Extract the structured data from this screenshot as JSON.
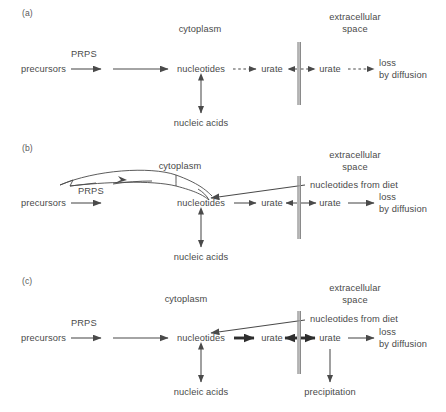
{
  "figure": {
    "type": "biochemical-pathway-diagram",
    "background": "#ffffff",
    "stroke_color": "#4a4a4a",
    "text_color": "#4a4a4a",
    "membrane_color": "#8a8a8a",
    "width": 446,
    "height": 412,
    "panel_count": 3
  },
  "panels": [
    {
      "tag": "(a)",
      "tag_x": 22,
      "tag_y": 8,
      "compartment_labels": [
        {
          "name": "cytoplasm",
          "text": "cytoplasm",
          "x": 200,
          "y": 24
        },
        {
          "name": "extracellular-space",
          "text": "extracellular\nspace",
          "line1": "extracellular",
          "line2": "space",
          "x": 355,
          "y": 12
        }
      ],
      "nodes": [
        {
          "id": "precursors",
          "text": "precursors",
          "x": 21,
          "y": 72,
          "align": "left"
        },
        {
          "id": "prps",
          "text": "PRPS",
          "x": 71,
          "y": 57,
          "align": "left"
        },
        {
          "id": "nucleotides",
          "text": "nucleotides",
          "x": 201,
          "y": 72,
          "align": "center"
        },
        {
          "id": "urate-in",
          "text": "urate",
          "x": 272,
          "y": 72,
          "align": "center"
        },
        {
          "id": "urate-out",
          "text": "urate",
          "x": 330,
          "y": 72,
          "align": "center"
        },
        {
          "id": "loss-by-diffusion",
          "line1": "loss",
          "line2": "by diffusion",
          "x": 379,
          "y": 66,
          "align": "left"
        },
        {
          "id": "nucleic-acids",
          "text": "nucleic acids",
          "x": 201,
          "y": 123,
          "align": "center"
        }
      ],
      "arrows": [
        {
          "from": "precursors",
          "to": "prps-step",
          "style": "solid"
        },
        {
          "from": "prps-step",
          "to": "nucleotides",
          "style": "solid"
        },
        {
          "from": "nucleotides",
          "to": "urate-in",
          "style": "dashed"
        },
        {
          "from": "urate-in",
          "to": "membrane",
          "style": "dashed",
          "direction": "left"
        },
        {
          "from": "membrane",
          "to": "urate-out",
          "style": "dashed"
        },
        {
          "from": "urate-out",
          "to": "loss",
          "style": "dashed"
        },
        {
          "from": "nucleotides",
          "to": "nucleic-acids",
          "style": "solid",
          "direction": "both"
        }
      ],
      "membrane": {
        "x": 299,
        "y_top": 42,
        "y_bottom": 105
      }
    },
    {
      "tag": "(b)",
      "tag_x": 22,
      "tag_y": 143,
      "compartment_labels": [
        {
          "name": "cytoplasm",
          "text": "cytoplasm",
          "x": 180,
          "y": 165
        },
        {
          "name": "extracellular-space",
          "text": "extracellular\nspace",
          "line1": "extracellular",
          "line2": "space",
          "x": 355,
          "y": 155
        }
      ],
      "nodes": [
        {
          "id": "precursors",
          "text": "precursors",
          "x": 21,
          "y": 206,
          "align": "left"
        },
        {
          "id": "prps",
          "text": "PRPS",
          "x": 78,
          "y": 192,
          "align": "left",
          "note": "distorted-glyph"
        },
        {
          "id": "nucleotides",
          "text": "nucleotides",
          "x": 201,
          "y": 206,
          "align": "center"
        },
        {
          "id": "urate-in",
          "text": "urate",
          "x": 272,
          "y": 206,
          "align": "center"
        },
        {
          "id": "urate-out",
          "text": "urate",
          "x": 330,
          "y": 206,
          "align": "center"
        },
        {
          "id": "loss-by-diffusion",
          "line1": "loss",
          "line2": "by diffusion",
          "x": 379,
          "y": 200,
          "align": "left"
        },
        {
          "id": "nucleotides-from-diet",
          "text": "nucleotides from diet",
          "x": 310,
          "y": 186,
          "align": "left"
        },
        {
          "id": "nucleic-acids",
          "text": "nucleic acids",
          "x": 201,
          "y": 257,
          "align": "center"
        }
      ],
      "arrows": [
        {
          "from": "precursors",
          "to": "prps-step",
          "style": "solid"
        },
        {
          "from": "prps-step",
          "to": "nucleotides",
          "style": "distorted-curve",
          "note": "warped ribbon artifact"
        },
        {
          "from": "nucleotides",
          "to": "urate-in",
          "style": "solid"
        },
        {
          "from": "urate-in",
          "to": "membrane",
          "style": "solid",
          "direction": "left"
        },
        {
          "from": "membrane",
          "to": "urate-out",
          "style": "solid"
        },
        {
          "from": "urate-out",
          "to": "loss",
          "style": "solid"
        },
        {
          "from": "nucleotides-from-diet",
          "to": "nucleotides",
          "style": "solid",
          "direction": "diagonal-left"
        },
        {
          "from": "nucleotides",
          "to": "nucleic-acids",
          "style": "solid",
          "direction": "both"
        }
      ],
      "membrane": {
        "x": 299,
        "y_top": 176,
        "y_bottom": 239
      }
    },
    {
      "tag": "(c)",
      "tag_x": 22,
      "tag_y": 276,
      "compartment_labels": [
        {
          "name": "cytoplasm",
          "text": "cytoplasm",
          "x": 186,
          "y": 297
        },
        {
          "name": "extracellular-space",
          "text": "extracellular\nspace",
          "line1": "extracellular",
          "line2": "space",
          "x": 355,
          "y": 287
        }
      ],
      "nodes": [
        {
          "id": "precursors",
          "text": "precursors",
          "x": 21,
          "y": 341,
          "align": "left"
        },
        {
          "id": "prps",
          "text": "PRPS",
          "x": 71,
          "y": 326,
          "align": "left"
        },
        {
          "id": "nucleotides",
          "text": "nucleotides",
          "x": 201,
          "y": 341,
          "align": "center"
        },
        {
          "id": "urate-in",
          "text": "urate",
          "x": 272,
          "y": 341,
          "align": "center"
        },
        {
          "id": "urate-out",
          "text": "urate",
          "x": 330,
          "y": 341,
          "align": "center"
        },
        {
          "id": "loss-by-diffusion",
          "line1": "loss",
          "line2": "by diffusion",
          "x": 379,
          "y": 335,
          "align": "left"
        },
        {
          "id": "nucleotides-from-diet",
          "text": "nucleotides from diet",
          "x": 310,
          "y": 320,
          "align": "left"
        },
        {
          "id": "nucleic-acids",
          "text": "nucleic acids",
          "x": 201,
          "y": 392,
          "align": "center"
        },
        {
          "id": "precipitation",
          "text": "precipitation",
          "x": 330,
          "y": 392,
          "align": "center"
        }
      ],
      "arrows": [
        {
          "from": "precursors",
          "to": "prps-step",
          "style": "solid"
        },
        {
          "from": "prps-step",
          "to": "nucleotides",
          "style": "solid"
        },
        {
          "from": "nucleotides",
          "to": "urate-in",
          "style": "bold"
        },
        {
          "from": "urate-in",
          "to": "membrane",
          "style": "bold",
          "direction": "left"
        },
        {
          "from": "membrane",
          "to": "urate-out",
          "style": "bold"
        },
        {
          "from": "urate-out",
          "to": "loss",
          "style": "solid"
        },
        {
          "from": "nucleotides-from-diet",
          "to": "nucleotides",
          "style": "solid",
          "direction": "diagonal-left"
        },
        {
          "from": "nucleotides",
          "to": "nucleic-acids",
          "style": "solid",
          "direction": "both"
        },
        {
          "from": "urate-out",
          "to": "precipitation",
          "style": "solid",
          "direction": "down"
        }
      ],
      "membrane": {
        "x": 299,
        "y_top": 311,
        "y_bottom": 374
      }
    }
  ]
}
